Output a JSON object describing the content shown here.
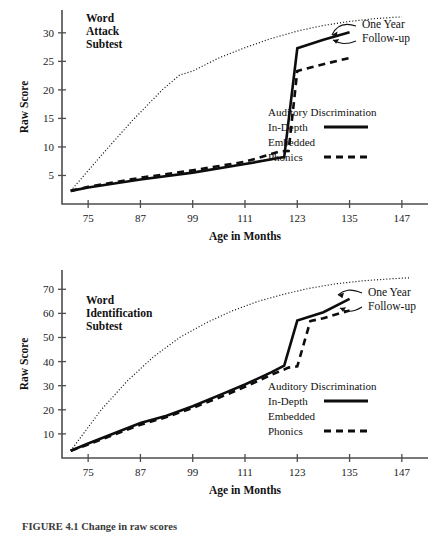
{
  "figure": {
    "caption": "FIGURE 4.1   Change in raw scores"
  },
  "chart_data": [
    {
      "type": "line",
      "panel_id": "word-attack",
      "title": "Word Attack Subtest",
      "title_lines": [
        "Word",
        "Attack",
        "Subtest"
      ],
      "xlabel": "Age in Months",
      "ylabel": "Raw Score",
      "xlim": [
        69,
        153
      ],
      "ylim": [
        0,
        34
      ],
      "xticks": [
        75,
        87,
        99,
        111,
        123,
        135,
        147
      ],
      "yticks": [
        5,
        10,
        15,
        20,
        25,
        30
      ],
      "grid": false,
      "legend_position": "center-right",
      "annotation": {
        "text": "One Year Follow-up",
        "lines": [
          "One Year",
          "Follow-up"
        ]
      },
      "series": [
        {
          "name": "Auditory Discrimination In-Depth",
          "style": "solid",
          "x": [
            71,
            75,
            87,
            99,
            111,
            119,
            120,
            123,
            129,
            135
          ],
          "y": [
            2.3,
            2.9,
            4.3,
            5.5,
            7.0,
            8.1,
            8.2,
            27.3,
            28.8,
            30.1
          ]
        },
        {
          "name": "Embedded Phonics",
          "style": "dashed",
          "x": [
            71,
            75,
            87,
            99,
            111,
            119,
            121,
            123,
            129,
            135
          ],
          "y": [
            2.3,
            3.0,
            4.6,
            5.9,
            7.4,
            9.2,
            9.3,
            23.3,
            24.5,
            25.6
          ]
        },
        {
          "name": "Normal reference trend",
          "style": "dotted",
          "x": [
            71,
            78,
            85,
            92,
            96,
            99,
            105,
            111,
            117,
            123,
            129,
            135,
            141,
            147
          ],
          "y": [
            2.3,
            8.5,
            14.5,
            20.0,
            22.6,
            23.3,
            25.6,
            27.4,
            29.0,
            30.3,
            31.3,
            32.0,
            32.5,
            32.8
          ]
        }
      ]
    },
    {
      "type": "line",
      "panel_id": "word-identification",
      "title": "Word Identification Subtest",
      "title_lines": [
        "Word",
        "Identification",
        "Subtest"
      ],
      "xlabel": "Age in Months",
      "ylabel": "Raw Score",
      "xlim": [
        69,
        153
      ],
      "ylim": [
        0,
        78
      ],
      "xticks": [
        75,
        87,
        99,
        111,
        123,
        135,
        147
      ],
      "yticks": [
        10,
        20,
        30,
        40,
        50,
        60,
        70
      ],
      "grid": false,
      "legend_position": "center-right",
      "annotation": {
        "text": "One Year Follow-up",
        "lines": [
          "One Year",
          "Follow-up"
        ]
      },
      "series": [
        {
          "name": "Auditory Discrimination In-Depth",
          "style": "solid",
          "x": [
            71,
            75,
            87,
            93,
            99,
            105,
            111,
            117,
            120,
            123,
            129,
            135
          ],
          "y": [
            3.0,
            6.0,
            14.5,
            17.5,
            21.5,
            26.0,
            30.5,
            35.5,
            38.3,
            57.0,
            60.5,
            66.0
          ]
        },
        {
          "name": "Embedded Phonics",
          "style": "dashed",
          "x": [
            71,
            75,
            87,
            93,
            99,
            105,
            111,
            117,
            121,
            123,
            126,
            129,
            135
          ],
          "y": [
            3.0,
            5.6,
            13.8,
            17.0,
            20.8,
            25.0,
            29.5,
            34.5,
            37.5,
            38.0,
            56.8,
            58.0,
            61.2
          ]
        },
        {
          "name": "Normal reference trend",
          "style": "dotted",
          "x": [
            71,
            78,
            84,
            90,
            96,
            102,
            108,
            114,
            120,
            126,
            132,
            138,
            144,
            149
          ],
          "y": [
            3.0,
            20.0,
            32.0,
            42.0,
            50.0,
            56.0,
            61.0,
            65.0,
            68.0,
            70.5,
            72.3,
            73.5,
            74.3,
            74.8
          ]
        }
      ]
    }
  ],
  "legend": {
    "series_label_lines": [
      "Auditory Discrimination",
      "In-Depth",
      "Embedded",
      "Phonics"
    ],
    "entries": [
      {
        "label_line_1": "Auditory Discrimination",
        "label_line_2": "In-Depth",
        "style": "solid"
      },
      {
        "label_line_1": "Embedded",
        "label_line_2": "Phonics",
        "style": "dashed"
      }
    ]
  }
}
